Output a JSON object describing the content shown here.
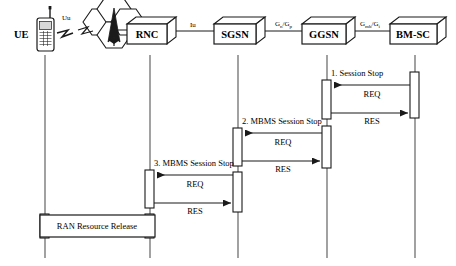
{
  "diagram": {
    "type": "sequence-diagram"
  },
  "nodes": [
    {
      "id": "ue",
      "label": "UE",
      "x": 45,
      "icon": "mobile-phone-icon"
    },
    {
      "id": "rnc",
      "label": "RNC",
      "x": 150,
      "icon": "network-node-box-icon"
    },
    {
      "id": "sgsn",
      "label": "SGSN",
      "x": 238,
      "icon": "network-node-box-icon"
    },
    {
      "id": "ggsn",
      "label": "GGSN",
      "x": 327,
      "icon": "network-node-box-icon"
    },
    {
      "id": "bmsc",
      "label": "BM-SC",
      "x": 415,
      "icon": "network-node-box-icon"
    }
  ],
  "interfaces": [
    {
      "id": "uu",
      "label": "Uu",
      "base": "Uu",
      "sub": "",
      "sub2": "",
      "x": 68,
      "y": 22
    },
    {
      "id": "iu",
      "label": "Iu",
      "base": "Iu",
      "sub": "",
      "sub2": "",
      "x": 194,
      "y": 32
    },
    {
      "id": "gn_gp",
      "label": "Gn/Gp",
      "base": "G",
      "sub": "n",
      "base2": "/G",
      "sub2": "p",
      "x": 283,
      "y": 30
    },
    {
      "id": "gmb_gi",
      "label": "Gmb/Gi",
      "base": "G",
      "sub": "mb",
      "base2": "/G",
      "sub2": "i",
      "x": 370,
      "y": 30
    }
  ],
  "messages": [
    {
      "id": "step1",
      "title": "1. Session Stop",
      "req_label": "REQ",
      "res_label": "RES",
      "from": "bmsc",
      "to": "ggsn",
      "title_x": 331,
      "title_y": 76,
      "req_y": 85,
      "req_label_x": 372,
      "req_label_y": 96,
      "res_y": 113,
      "res_label_x": 372,
      "res_label_y": 110
    },
    {
      "id": "step2",
      "title": "2. MBMS Session Stop",
      "req_label": "REQ",
      "res_label": "RES",
      "from": "ggsn",
      "to": "sgsn",
      "title_x": 242,
      "title_y": 124,
      "req_y": 133,
      "req_label_x": 283,
      "req_label_y": 144,
      "res_y": 161,
      "res_label_x": 283,
      "res_label_y": 158
    },
    {
      "id": "step3",
      "title": "3. MBMS Session Stop",
      "req_label": "REQ",
      "res_label": "RES",
      "from": "sgsn",
      "to": "rnc",
      "title_x": 154,
      "title_y": 166,
      "req_y": 175,
      "req_label_x": 195,
      "req_label_y": 186,
      "res_y": 203,
      "res_label_x": 195,
      "res_label_y": 200
    }
  ],
  "action_box": {
    "id": "ran-resource-release",
    "label": "RAN Resource Release",
    "x": 40,
    "y": 215,
    "width": 115,
    "height": 22,
    "label_x": 97,
    "label_y": 229
  },
  "activations": [
    {
      "id": "bmsc-act-1",
      "node": "bmsc",
      "x": 415,
      "y": 72,
      "height": 46
    },
    {
      "id": "ggsn-act-1",
      "node": "ggsn",
      "x": 327,
      "y": 80,
      "height": 39
    },
    {
      "id": "ggsn-act-2",
      "node": "ggsn",
      "x": 327,
      "y": 126,
      "height": 42
    },
    {
      "id": "sgsn-act-1",
      "node": "sgsn",
      "x": 238,
      "y": 128,
      "height": 38
    },
    {
      "id": "sgsn-act-2",
      "node": "sgsn",
      "x": 238,
      "y": 172,
      "height": 40
    },
    {
      "id": "rnc-act-1",
      "node": "rnc",
      "x": 150,
      "y": 170,
      "height": 38
    },
    {
      "id": "rnc-act-2",
      "node": "rnc",
      "x": 150,
      "y": 214,
      "height": 24
    },
    {
      "id": "ue-act-1",
      "node": "ue",
      "x": 45,
      "y": 214,
      "height": 24
    }
  ],
  "colors": {
    "line": "#1a1a1a",
    "fill": "#ffffff",
    "text": "#000000",
    "background": "#ffffff"
  },
  "lifeline": {
    "top": 55,
    "bottom": 258
  }
}
